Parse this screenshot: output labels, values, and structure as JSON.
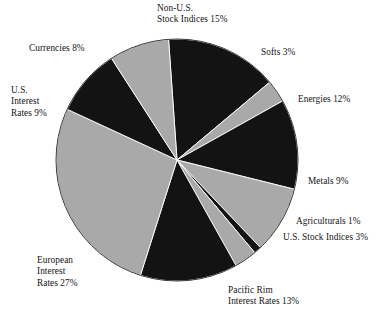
{
  "figure": {
    "name": "asset-class-allocation-pie",
    "background_color": "#ffffff"
  },
  "chart_data": {
    "type": "pie",
    "title": "",
    "subtitle": "",
    "xlabel": "",
    "ylabel": "",
    "legend_position": "none",
    "grid": false,
    "units": "percent",
    "start_angle_deg": -4,
    "direction": "clockwise",
    "center": {
      "x": 177,
      "y": 160
    },
    "radius": 121,
    "total": 100,
    "palette": {
      "dark": "#131313",
      "light": "#a9a9a9",
      "outline": "#3a3a3a"
    },
    "categories": [
      "Non-U.S. Stock Indices",
      "Softs",
      "Energies",
      "Metals",
      "Agriculturals",
      "U.S. Stock Indices",
      "Pacific Rim Interest Rates",
      "European Interest Rates",
      "U.S. Interest Rates",
      "Currencies"
    ],
    "values": [
      15,
      3,
      12,
      9,
      1,
      3,
      13,
      27,
      9,
      8
    ],
    "slices": [
      {
        "label": "Non-U.S. Stock Indices",
        "value": 15,
        "color": "#131313"
      },
      {
        "label": "Softs",
        "value": 3,
        "color": "#a9a9a9"
      },
      {
        "label": "Energies",
        "value": 12,
        "color": "#131313"
      },
      {
        "label": "Metals",
        "value": 9,
        "color": "#a9a9a9"
      },
      {
        "label": "Agriculturals",
        "value": 1,
        "color": "#131313"
      },
      {
        "label": "U.S. Stock Indices",
        "value": 3,
        "color": "#a9a9a9"
      },
      {
        "label": "Pacific Rim Interest Rates",
        "value": 13,
        "color": "#131313"
      },
      {
        "label": "European Interest Rates",
        "value": 27,
        "color": "#a9a9a9"
      },
      {
        "label": "U.S. Interest Rates",
        "value": 9,
        "color": "#131313"
      },
      {
        "label": "Currencies",
        "value": 8,
        "color": "#a9a9a9"
      }
    ]
  },
  "labels": {
    "non_us_stock_indices": {
      "line1": "Non-U.S.",
      "line2": "Stock Indices 15%"
    },
    "softs": {
      "line1": "Softs 3%"
    },
    "energies": {
      "line1": "Energies 12%"
    },
    "metals": {
      "line1": "Metals 9%"
    },
    "agriculturals": {
      "line1": "Agriculturals 1%"
    },
    "us_stock_indices": {
      "line1": "U.S. Stock Indices 3%"
    },
    "pacific_rim": {
      "line1": "Pacific Rim",
      "line2": "Interest Rates 13%"
    },
    "european": {
      "line1": "European",
      "line2": "Interest",
      "line3": "Rates 27%"
    },
    "us_interest": {
      "line1": "U.S.",
      "line2": "Interest",
      "line3": "Rates 9%"
    },
    "currencies": {
      "line1": "Currencies 8%"
    }
  }
}
